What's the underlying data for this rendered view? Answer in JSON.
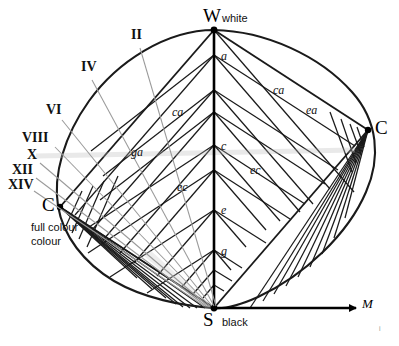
{
  "diagram": {
    "background": "#ffffff",
    "line_color": "#1a1a1a",
    "leader_color": "#9a9a9a",
    "vertices": {
      "white": {
        "symbol": "W",
        "name": "white",
        "x": 214,
        "y": 30
      },
      "black": {
        "symbol": "S",
        "name": "black",
        "x": 214,
        "y": 308
      },
      "full_colour_left": {
        "symbol": "C",
        "name": "full colour",
        "x": 60,
        "y": 207
      },
      "full_colour_right": {
        "symbol": "C",
        "name": "",
        "x": 368,
        "y": 130
      }
    },
    "axis": {
      "symbol": "M",
      "x": 360,
      "y": 308
    }
  },
  "roman_labels": [
    {
      "text": "II",
      "x": 131,
      "y": 30,
      "lx": 140,
      "ly": 48,
      "tx": 216,
      "ty": 306
    },
    {
      "text": "IV",
      "x": 81,
      "y": 62,
      "lx": 92,
      "ly": 80,
      "tx": 214,
      "ty": 306
    },
    {
      "text": "VI",
      "x": 46,
      "y": 105,
      "lx": 62,
      "ly": 120,
      "tx": 212,
      "ty": 306
    },
    {
      "text": "VIII",
      "x": 24,
      "y": 133,
      "lx": 55,
      "ly": 147,
      "tx": 210,
      "ty": 306
    },
    {
      "text": "X",
      "x": 27,
      "y": 152,
      "lx": 40,
      "ly": 163,
      "tx": 208,
      "ty": 306
    },
    {
      "text": "XII",
      "x": 14,
      "y": 168,
      "lx": 36,
      "ly": 178,
      "tx": 206,
      "ty": 306
    },
    {
      "text": "XIV",
      "x": 10,
      "y": 183,
      "lx": 34,
      "ly": 191,
      "tx": 204,
      "ty": 306
    }
  ],
  "axis_labels": [
    {
      "text": "a",
      "x": 222,
      "y": 55
    },
    {
      "text": "c",
      "x": 222,
      "y": 145
    },
    {
      "text": "e",
      "x": 222,
      "y": 210
    },
    {
      "text": "g",
      "x": 222,
      "y": 250
    }
  ],
  "grid_labels": [
    {
      "text": "ca",
      "x": 175,
      "y": 112
    },
    {
      "text": "ga",
      "x": 133,
      "y": 152
    },
    {
      "text": "ec",
      "x": 179,
      "y": 187
    },
    {
      "text": "ca",
      "x": 276,
      "y": 90
    },
    {
      "text": "ea",
      "x": 310,
      "y": 110
    },
    {
      "text": "ec",
      "x": 253,
      "y": 170
    }
  ],
  "corner_mark": {
    "text": "i",
    "x": 379,
    "y": 327
  }
}
